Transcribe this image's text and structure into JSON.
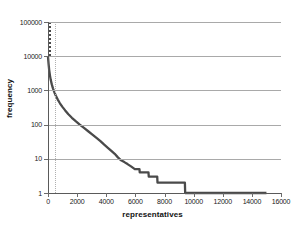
{
  "chart_data": {
    "type": "line",
    "title": "",
    "subtitle": "",
    "xlabel": "representatives",
    "ylabel": "frequency",
    "xlim": [
      0,
      16000
    ],
    "ylim": [
      1,
      100000
    ],
    "yscale": "log",
    "xscale": "linear",
    "grid": "horizontal",
    "legend": "none",
    "x_ticks": [
      0,
      2000,
      4000,
      6000,
      8000,
      10000,
      12000,
      14000,
      16000
    ],
    "x_tick_labels": [
      "0",
      "2000",
      "4000",
      "6000",
      "8000",
      "10000",
      "12000",
      "14000",
      "16000"
    ],
    "y_ticks": [
      1,
      10,
      100,
      1000,
      10000,
      100000
    ],
    "y_tick_labels": [
      "1",
      "10",
      "100",
      "1000",
      "10000",
      "100000"
    ],
    "series": [
      {
        "name": "frequency",
        "color": "#4a4a4a",
        "points": [
          [
            0,
            9500
          ],
          [
            40,
            6000
          ],
          [
            80,
            4000
          ],
          [
            130,
            2800
          ],
          [
            190,
            2000
          ],
          [
            260,
            1500
          ],
          [
            340,
            1150
          ],
          [
            430,
            900
          ],
          [
            540,
            700
          ],
          [
            670,
            540
          ],
          [
            820,
            420
          ],
          [
            990,
            330
          ],
          [
            1180,
            260
          ],
          [
            1400,
            200
          ],
          [
            1640,
            158
          ],
          [
            1900,
            126
          ],
          [
            2180,
            100
          ],
          [
            2470,
            80
          ],
          [
            2760,
            64
          ],
          [
            3050,
            51
          ],
          [
            3330,
            41
          ],
          [
            3600,
            33
          ],
          [
            3860,
            26
          ],
          [
            4110,
            21
          ],
          [
            4350,
            17
          ],
          [
            4580,
            14
          ],
          [
            4800,
            11
          ],
          [
            5020,
            9
          ],
          [
            5240,
            8
          ],
          [
            5460,
            7
          ],
          [
            5700,
            6
          ],
          [
            5960,
            5
          ],
          [
            6280,
            5
          ],
          [
            6300,
            4
          ],
          [
            6900,
            4
          ],
          [
            6920,
            3
          ],
          [
            7500,
            3
          ],
          [
            7520,
            2
          ],
          [
            9400,
            2
          ],
          [
            9420,
            1
          ],
          [
            15000,
            1
          ]
        ]
      }
    ],
    "annotations": [
      {
        "type": "vertical-dotted-line",
        "x": 500,
        "color": "#b0b0b0"
      },
      {
        "type": "vertical-dotted-line",
        "x": 0,
        "color": "#4a4a4a",
        "partial": "top"
      }
    ]
  },
  "axes": {
    "x_title": "representatives",
    "y_title": "frequency"
  }
}
